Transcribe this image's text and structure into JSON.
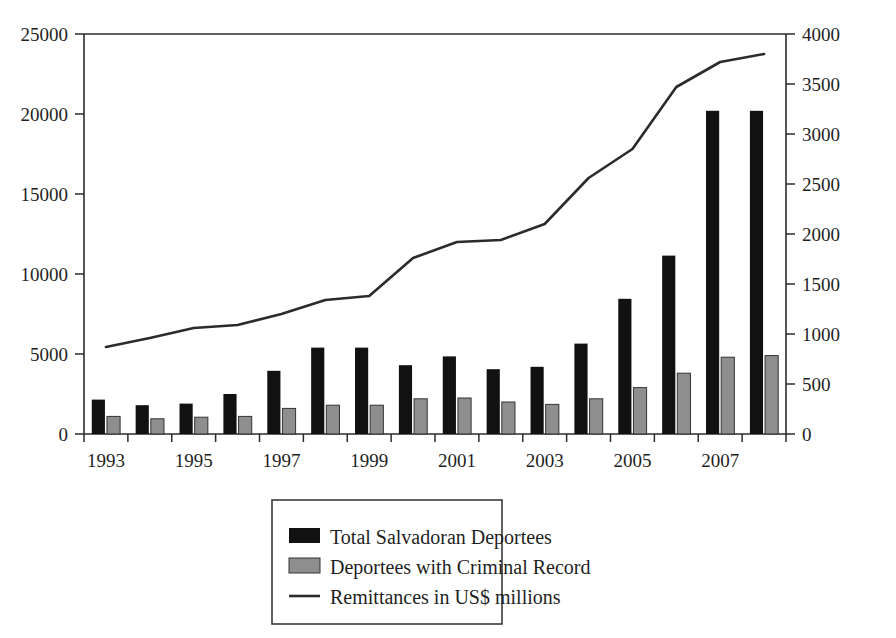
{
  "chart_data": {
    "type": "bar",
    "title": "",
    "subtitle": "",
    "xlabel": "",
    "ylabel": "",
    "y2label": "",
    "grid": false,
    "legend_position": "bottom-center",
    "categories": [
      "1993",
      "1994",
      "1995",
      "1996",
      "1997",
      "1998",
      "1999",
      "2000",
      "2001",
      "2002",
      "2003",
      "2004",
      "2005",
      "2006",
      "2007",
      "2008"
    ],
    "x_tick_labels": [
      "1993",
      "",
      "1995",
      "",
      "1997",
      "",
      "1999",
      "",
      "2001",
      "",
      "2003",
      "",
      "2005",
      "",
      "2007",
      ""
    ],
    "y_left_ticks": [
      0,
      5000,
      10000,
      15000,
      20000,
      25000
    ],
    "ylim": [
      0,
      25000
    ],
    "y_right_ticks": [
      0,
      500,
      1000,
      1500,
      2000,
      2500,
      3000,
      3500,
      4000
    ],
    "y2lim": [
      0,
      4000
    ],
    "series": [
      {
        "name": "Total Salvadoran Deportees",
        "type": "bar",
        "axis": "left",
        "color": "#111111",
        "values": [
          2150,
          1800,
          1900,
          2500,
          3950,
          5400,
          5400,
          4300,
          4850,
          4050,
          4200,
          5650,
          8450,
          11150,
          20200,
          20200
        ]
      },
      {
        "name": "Deportees with Criminal Record",
        "type": "bar",
        "axis": "left",
        "color": "#8e8e8e",
        "values": [
          1100,
          950,
          1050,
          1100,
          1600,
          1800,
          1800,
          2200,
          2250,
          2000,
          1850,
          2200,
          2900,
          3800,
          4800,
          4900
        ]
      },
      {
        "name": "Remittances in US$ millions",
        "type": "line",
        "axis": "right",
        "color": "#2b2b2b",
        "values": [
          870,
          960,
          1060,
          1090,
          1200,
          1340,
          1380,
          1760,
          1920,
          1940,
          2100,
          2560,
          2850,
          3470,
          3720,
          3800
        ]
      }
    ]
  },
  "legend": {
    "items": [
      {
        "label": "Total Salvadoran Deportees",
        "marker": "square-black"
      },
      {
        "label": "Deportees with Criminal Record",
        "marker": "square-gray"
      },
      {
        "label": "Remittances in US$ millions",
        "marker": "line-dark"
      }
    ]
  },
  "axes": {
    "left_tick_labels": [
      "25000",
      "20000",
      "15000",
      "10000",
      "5000",
      "0"
    ],
    "right_tick_labels": [
      "4000",
      "3500",
      "3000",
      "2500",
      "2000",
      "1500",
      "1000",
      "500",
      "0"
    ],
    "bottom_tick_labels": [
      "1993",
      "1995",
      "1997",
      "1999",
      "2001",
      "2003",
      "2005",
      "2007"
    ]
  }
}
